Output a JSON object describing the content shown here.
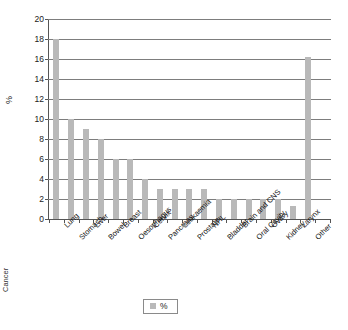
{
  "chart_data": {
    "type": "bar",
    "title": "",
    "xlabel": "Cancer",
    "ylabel": "%",
    "ylim": [
      0,
      20
    ],
    "ytick_step": 2,
    "yticks": [
      0,
      2,
      4,
      6,
      8,
      10,
      12,
      14,
      16,
      18,
      20
    ],
    "grid": true,
    "legend_position": "bottom",
    "bar_color": "#b9b9b9",
    "series": [
      {
        "name": "%",
        "values": [
          18,
          10,
          9,
          8,
          6,
          6,
          4,
          3,
          3,
          3,
          3,
          2,
          2,
          2,
          2,
          2,
          1.3,
          16.2
        ]
      }
    ],
    "categories": [
      "Lung",
      "Stomach",
      "Liver",
      "Bowel",
      "Breast",
      "Oesophagus",
      "Cervix",
      "Pancreas",
      "Leukaemia",
      "Prostate",
      "NHL",
      "Bladder",
      "Brain and CNS",
      "Oral Cavity",
      "Ovary",
      "Kidney",
      "Larynx",
      "Other"
    ]
  },
  "legend": {
    "entries": [
      {
        "label": "%",
        "color": "#b9b9b9"
      }
    ]
  }
}
